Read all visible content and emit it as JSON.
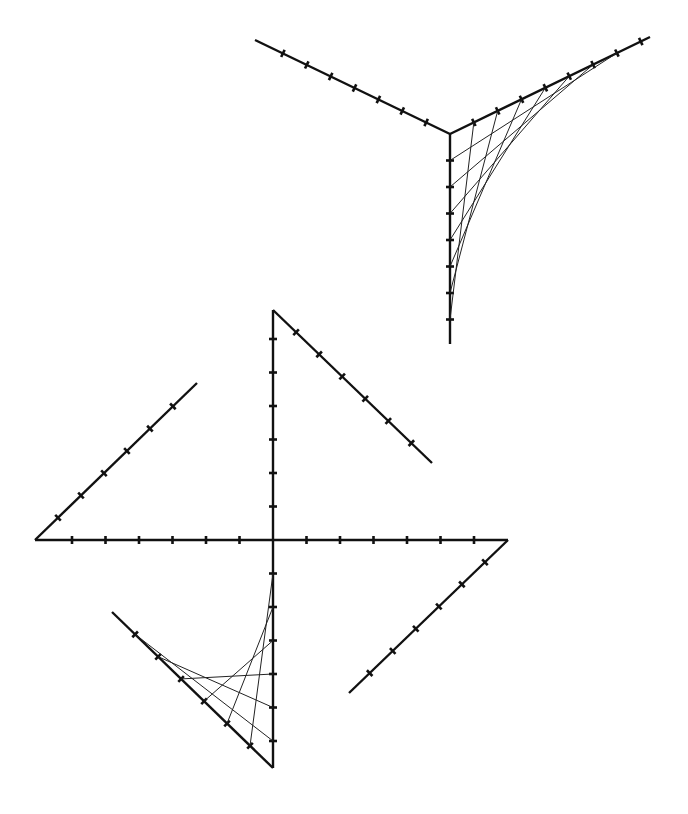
{
  "diagram": {
    "title": "",
    "colors": {
      "background": "#ffffff",
      "line": "#111111",
      "stitch": "#222222"
    },
    "figures": [
      {
        "name": "y-figure",
        "center": [
          450,
          134
        ],
        "arms": [
          {
            "name": "arm-left",
            "end": [
              255,
              40
            ],
            "ticks": 7
          },
          {
            "name": "arm-right",
            "end": [
              650,
              37
            ],
            "ticks": 8
          },
          {
            "name": "arm-down",
            "end": [
              450,
              344
            ],
            "ticks": 7
          }
        ],
        "stitched_between": [
          "arm-right",
          "arm-down"
        ],
        "stitch_count": 7
      },
      {
        "name": "pinwheel-figure",
        "center": [
          273,
          540
        ],
        "arms": [
          {
            "name": "axis-up",
            "end": [
              273,
              310
            ],
            "ticks": 6
          },
          {
            "name": "axis-down",
            "end": [
              273,
              768
            ],
            "ticks": 6
          },
          {
            "name": "axis-left",
            "end": [
              35,
              540
            ],
            "ticks": 6
          },
          {
            "name": "axis-right",
            "end": [
              508,
              540
            ],
            "ticks": 6
          },
          {
            "name": "diag-upper-left",
            "from": [
              35,
              540
            ],
            "to": [
              197,
              383
            ],
            "ticks": 6
          },
          {
            "name": "diag-upper-right",
            "from": [
              273,
              310
            ],
            "to": [
              432,
              463
            ],
            "ticks": 6
          },
          {
            "name": "diag-lower-right",
            "from": [
              508,
              540
            ],
            "to": [
              349,
              693
            ],
            "ticks": 6
          },
          {
            "name": "diag-lower-left",
            "from": [
              273,
              768
            ],
            "to": [
              112,
              612
            ],
            "ticks": 6
          }
        ],
        "stitched_between": [
          "axis-down",
          "diag-lower-left"
        ],
        "stitch_count": 6
      }
    ]
  }
}
